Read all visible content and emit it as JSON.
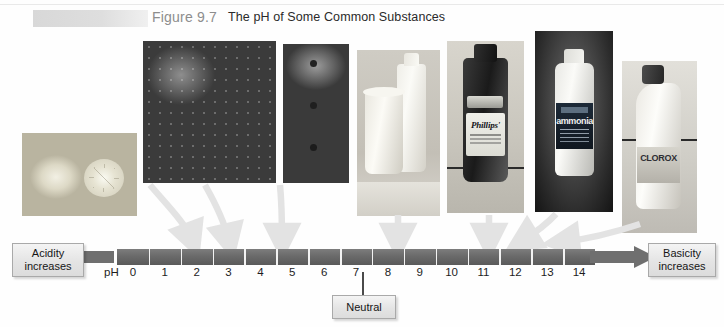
{
  "header": {
    "figure_number": "Figure 9.7",
    "title": "The pH of Some Common Substances"
  },
  "scale": {
    "axis_label": "pH",
    "ticks": [
      "0",
      "1",
      "2",
      "3",
      "4",
      "5",
      "6",
      "7",
      "8",
      "9",
      "10",
      "11",
      "12",
      "13",
      "14"
    ],
    "left_tag": "Acidity\nincreases",
    "left_tag_line1": "Acidity",
    "left_tag_line2": "increases",
    "right_tag_line1": "Basicity",
    "right_tag_line2": "increases",
    "neutral_label": "Neutral",
    "neutral_value": "7",
    "bar_color": "#6a6a6a",
    "tag_color": "#e4e4e4"
  },
  "photos": [
    {
      "name": "lemons",
      "caption": "Lemons / citrus fruit",
      "ph": "2.3"
    },
    {
      "name": "strawberries",
      "caption": "Strawberries",
      "ph": "3.5"
    },
    {
      "name": "apples",
      "caption": "Apples",
      "ph": "4.0"
    },
    {
      "name": "milk",
      "caption": "Milk",
      "ph": "6.6"
    },
    {
      "name": "phillips",
      "caption": "Phillips' Milk of Magnesia",
      "ph": "10.5",
      "brand": "Phillips'"
    },
    {
      "name": "ammonia",
      "caption": "Household ammonia",
      "ph": "11.1",
      "brand": "ammonia"
    },
    {
      "name": "clorox",
      "caption": "Clorox bleach",
      "ph": "12.2",
      "brand": "CLOROX"
    }
  ],
  "chart_data": {
    "type": "scatter",
    "title": "The pH of Some Common Substances",
    "xlabel": "pH",
    "xlim": [
      0,
      14
    ],
    "x": [
      2.3,
      3.5,
      4.0,
      6.6,
      10.5,
      11.1,
      12.2
    ],
    "categories": [
      "Lemons",
      "Strawberries",
      "Apples",
      "Milk",
      "Phillips' Milk of Magnesia",
      "Household ammonia",
      "Clorox bleach"
    ],
    "tick_labels": [
      "0",
      "1",
      "2",
      "3",
      "4",
      "5",
      "6",
      "7",
      "8",
      "9",
      "10",
      "11",
      "12",
      "13",
      "14"
    ],
    "annotations": [
      "Acidity increases",
      "Neutral",
      "Basicity increases"
    ],
    "grid": false,
    "legend": "none"
  }
}
